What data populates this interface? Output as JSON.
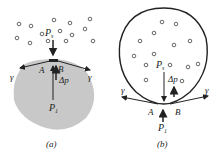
{
  "panels": [
    {
      "id": "a",
      "caption": "(a)",
      "labels": {
        "p_outer": "P",
        "p_outer_sub": "s",
        "p_inner": "P",
        "p_inner_sub": "1",
        "delta_p": "Δp",
        "point_a": "A",
        "point_b": "B",
        "tension_left": "γ",
        "tension_right": "γ"
      },
      "description": "Liquid drop (shaded) surrounded by gas molecules; surface tension γ acts along surface AB"
    },
    {
      "id": "b",
      "caption": "(b)",
      "labels": {
        "p_outer": "P",
        "p_outer_sub": "s",
        "p_inner": "P",
        "p_inner_sub": "1",
        "delta_p": "Δp",
        "point_a": "A",
        "point_b": "B",
        "tension_left": "γ",
        "tension_right": "γ"
      },
      "description": "Gas bubble containing molecules inside liquid; surface tension γ acts along surface AB"
    }
  ],
  "colors": {
    "liquid": "#c8c8c8",
    "stroke": "#222222",
    "molecule": "#555555"
  }
}
